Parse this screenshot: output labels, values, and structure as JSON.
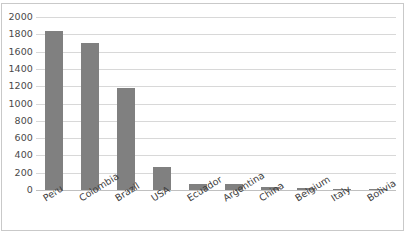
{
  "chart_data": {
    "type": "bar",
    "title": "",
    "subtitle": "",
    "xlabel": "",
    "ylabel": "",
    "categories": [
      "Peru",
      "Colombia",
      "Brazil",
      "USA",
      "Ecuador",
      "Argentina",
      "China",
      "Belgium",
      "Italy",
      "Bolivia"
    ],
    "values": [
      1840,
      1700,
      1180,
      265,
      75,
      65,
      35,
      20,
      15,
      12
    ],
    "series": [
      {
        "name": "Series 1",
        "values": [
          1840,
          1700,
          1180,
          265,
          75,
          65,
          35,
          20,
          15,
          12
        ]
      }
    ],
    "ylim": [
      0,
      2000
    ],
    "ytick_step": 200,
    "ytick_labels": [
      "2000",
      "1800",
      "1600",
      "1400",
      "1200",
      "1000",
      "800",
      "600",
      "400",
      "200",
      "0"
    ],
    "ytick_values": [
      2000,
      1800,
      1600,
      1400,
      1200,
      1000,
      800,
      600,
      400,
      200,
      0
    ],
    "grid": true,
    "grid_axis": "y",
    "legend": false,
    "legend_position": "none",
    "bar_color": "#808080",
    "gridline_color": "#d8d8d8",
    "axis_color": "#c0c0c0",
    "border_color": "#c9c9c9",
    "label_color": "#4a4a4a",
    "xlabel_rotation": -32
  }
}
